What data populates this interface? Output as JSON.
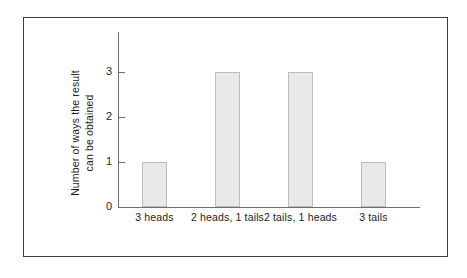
{
  "figure": {
    "frame_color": "#3d3d3d",
    "background_color": "#ffffff"
  },
  "chart_data": {
    "type": "bar",
    "title": "",
    "subtitle": "",
    "categories": [
      "3 heads",
      "2 heads,\n1 tails",
      "2 tails,\n1 heads",
      "3 tails"
    ],
    "category_lines": [
      [
        "3 heads"
      ],
      [
        "2 heads,",
        "1 tails"
      ],
      [
        "2 tails,",
        "1 heads"
      ],
      [
        "3 tails"
      ]
    ],
    "values": [
      1,
      3,
      3,
      1
    ],
    "xlabel": "",
    "ylabel": "Number of ways the result can be obtained",
    "ylabel_lines": [
      "Number of ways the result",
      "can be obtained"
    ],
    "ylim": [
      0,
      3.9
    ],
    "yticks": [
      0,
      1,
      2,
      3
    ],
    "ytick_labels": [
      "0",
      "1",
      "2",
      "3"
    ],
    "grid": false,
    "legend": false,
    "bar_fill_color": "#e9e9e9",
    "bar_edge_color": "#bdbdbd",
    "axis_color": "#6e6e6e",
    "text_color": "#1d1d1d"
  }
}
